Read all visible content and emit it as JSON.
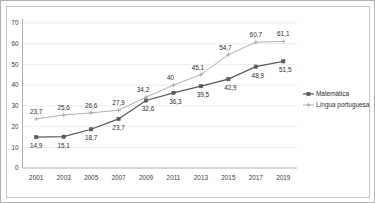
{
  "chart_data": {
    "type": "line",
    "title": "",
    "subtitle": "",
    "xlabel": "",
    "ylabel": "",
    "categories": [
      "2001",
      "2003",
      "2005",
      "2007",
      "2009",
      "2011",
      "2013",
      "2015",
      "2017",
      "2019"
    ],
    "ylim": [
      0,
      70
    ],
    "yticks": [
      0,
      10,
      20,
      30,
      40,
      50,
      60,
      70
    ],
    "ytick_labels": [
      "0",
      "10",
      "20",
      "30",
      "40",
      "50",
      "60",
      "70"
    ],
    "grid": true,
    "legend_position": "right",
    "series": [
      {
        "name": "Matemática",
        "color": "#595959",
        "marker": "square",
        "values": [
          14.9,
          15.1,
          18.7,
          23.7,
          32.6,
          36.3,
          39.5,
          42.9,
          48.9,
          51.5
        ],
        "data_labels": [
          "14,9",
          "15,1",
          "18,7",
          "23,7",
          "32,6",
          "36,3",
          "39,5",
          "42,9",
          "48,9",
          "51,5"
        ]
      },
      {
        "name": "Língua portuguesa",
        "color": "#a6a6a6",
        "marker": "cross",
        "values": [
          23.7,
          25.6,
          26.6,
          27.9,
          34.2,
          40.0,
          45.1,
          54.7,
          60.7,
          61.1
        ],
        "data_labels": [
          "23,7",
          "25,6",
          "26,6",
          "27,9",
          "34,2",
          "40",
          "45,1",
          "54,7",
          "60,7",
          "61,1"
        ]
      }
    ]
  },
  "legend": {
    "items": [
      {
        "label": "Matemática",
        "color": "#595959"
      },
      {
        "label": "Língua portuguesa",
        "color": "#a6a6a6"
      }
    ]
  }
}
